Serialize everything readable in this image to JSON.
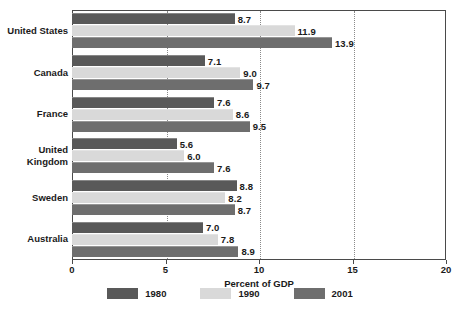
{
  "chart_data": {
    "type": "bar",
    "orientation": "horizontal",
    "title": "",
    "xlabel": "Percent of GDP",
    "ylabel": "",
    "xlim": [
      0,
      20
    ],
    "xticks": [
      0,
      5,
      10,
      15,
      20
    ],
    "xticklabels": [
      "0",
      "5",
      "10",
      "15",
      "20"
    ],
    "gridlines": [
      5,
      10,
      15
    ],
    "grid": true,
    "grid_style": "dotted",
    "legend_position": "bottom",
    "categories": [
      "United States",
      "Canada",
      "France",
      "United\nKingdom",
      "Sweden",
      "Australia"
    ],
    "series": [
      {
        "name": "1980",
        "color": "#595959",
        "values": [
          8.7,
          7.1,
          7.6,
          5.6,
          8.8,
          7.0
        ],
        "labels": [
          "8.7",
          "7.1",
          "7.6",
          "5.6",
          "8.8",
          "7.0"
        ]
      },
      {
        "name": "1990",
        "color": "#d9d9d9",
        "values": [
          11.9,
          9.0,
          8.6,
          6.0,
          8.2,
          7.8
        ],
        "labels": [
          "11.9",
          "9.0",
          "8.6",
          "6.0",
          "8.2",
          "7.8"
        ]
      },
      {
        "name": "2001",
        "color": "#6e6e6e",
        "values": [
          13.9,
          9.7,
          9.5,
          7.6,
          8.7,
          8.9
        ],
        "labels": [
          "13.9",
          "9.7",
          "9.5",
          "7.6",
          "8.7",
          "8.9"
        ]
      }
    ]
  },
  "axis": {
    "x_title": "Percent of GDP",
    "ticks": [
      "0",
      "5",
      "10",
      "15",
      "20"
    ]
  },
  "legend": {
    "items": [
      {
        "label": "1980",
        "color": "#595959"
      },
      {
        "label": "1990",
        "color": "#d9d9d9"
      },
      {
        "label": "2001",
        "color": "#6e6e6e"
      }
    ]
  },
  "colors": {
    "series_1980": "#595959",
    "series_1990": "#d9d9d9",
    "series_2001": "#6e6e6e",
    "frame": "#4a4a4a",
    "gridline": "#8a8a8a",
    "text": "#1a1a1a",
    "background": "#ffffff"
  }
}
